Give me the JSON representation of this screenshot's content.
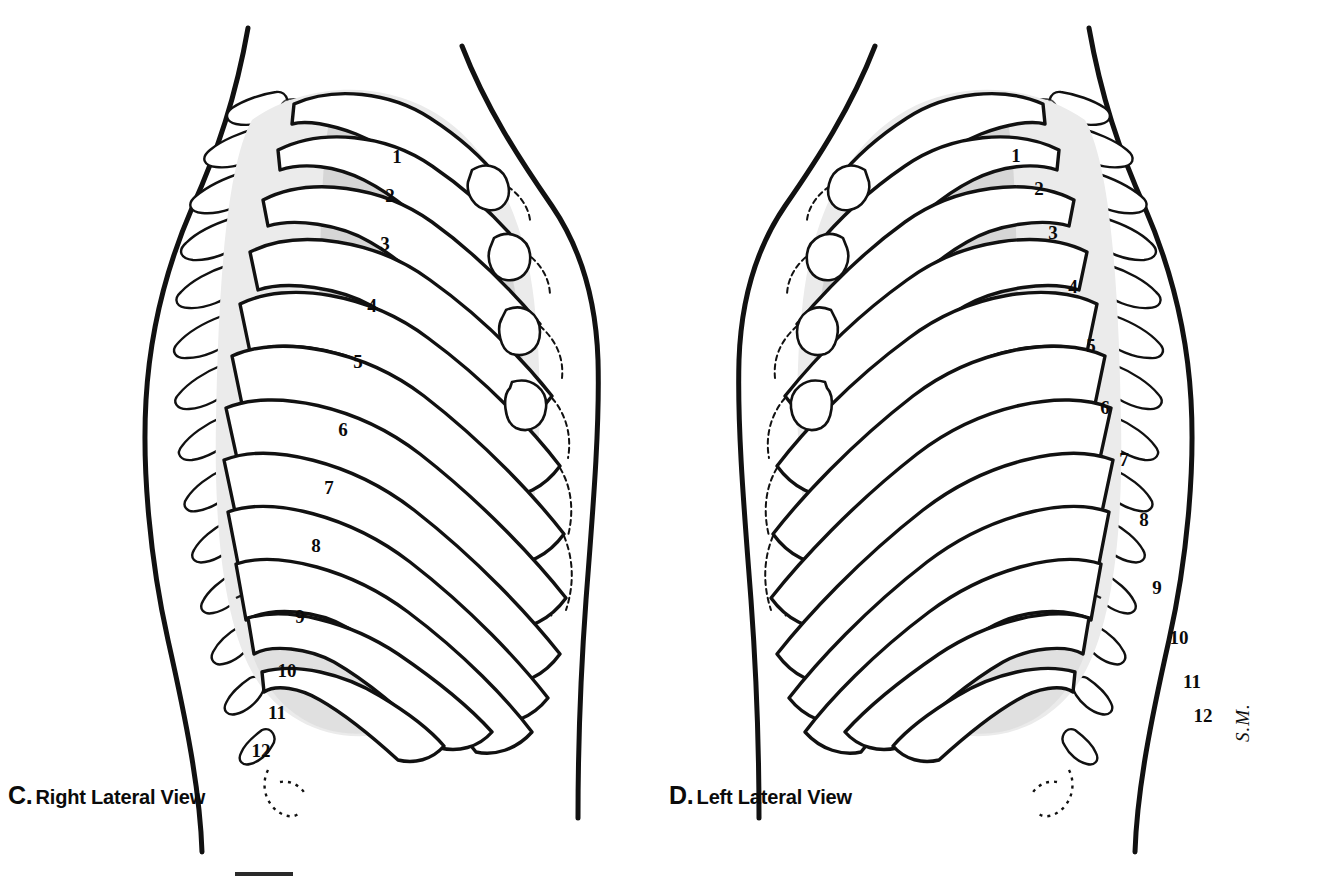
{
  "figure": {
    "background_color": "#ffffff",
    "ink_color": "#111111",
    "shade_light": "#ebebeb",
    "shade_mid": "#d8d8d8",
    "shade_dark": "#c2c2c2"
  },
  "panels": [
    {
      "id": "panel-c",
      "letter": "C.",
      "caption": "Right Lateral View",
      "side": "right",
      "rib_labels": [
        {
          "n": "1",
          "x": 397,
          "y": 158
        },
        {
          "n": "2",
          "x": 390,
          "y": 197
        },
        {
          "n": "3",
          "x": 385,
          "y": 245
        },
        {
          "n": "4",
          "x": 372,
          "y": 307
        },
        {
          "n": "5",
          "x": 358,
          "y": 363
        },
        {
          "n": "6",
          "x": 343,
          "y": 431
        },
        {
          "n": "7",
          "x": 329,
          "y": 489
        },
        {
          "n": "8",
          "x": 316,
          "y": 547
        },
        {
          "n": "9",
          "x": 300,
          "y": 618
        },
        {
          "n": "10",
          "x": 287,
          "y": 672
        },
        {
          "n": "11",
          "x": 277,
          "y": 714
        },
        {
          "n": "12",
          "x": 261,
          "y": 752
        }
      ]
    },
    {
      "id": "panel-d",
      "letter": "D.",
      "caption": "Left Lateral View",
      "side": "left",
      "rib_labels": [
        {
          "n": "1",
          "x": 1016,
          "y": 157
        },
        {
          "n": "2",
          "x": 1039,
          "y": 190
        },
        {
          "n": "3",
          "x": 1053,
          "y": 234
        },
        {
          "n": "4",
          "x": 1073,
          "y": 288
        },
        {
          "n": "5",
          "x": 1091,
          "y": 347
        },
        {
          "n": "6",
          "x": 1105,
          "y": 409
        },
        {
          "n": "7",
          "x": 1124,
          "y": 461
        },
        {
          "n": "8",
          "x": 1144,
          "y": 521
        },
        {
          "n": "9",
          "x": 1157,
          "y": 589
        },
        {
          "n": "10",
          "x": 1179,
          "y": 639
        },
        {
          "n": "11",
          "x": 1192,
          "y": 683
        },
        {
          "n": "12",
          "x": 1203,
          "y": 717
        }
      ]
    }
  ],
  "signature": "S.M.",
  "scalebar": {
    "visible": true
  }
}
